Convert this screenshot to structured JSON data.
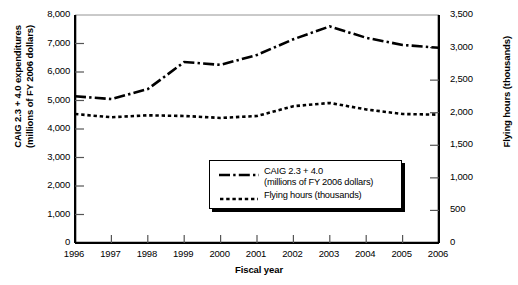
{
  "chart_data": {
    "type": "line",
    "title": "",
    "xlabel": "Fiscal year",
    "ylabel": "CAIG 2.3 + 4.0 expenditures (millions of FY 2006 dollars)",
    "ylabel_secondary": "Flying hours (thousands)",
    "categories": [
      "1996",
      "1997",
      "1998",
      "1999",
      "2000",
      "2001",
      "2002",
      "2003",
      "2004",
      "2005",
      "2006"
    ],
    "x": [
      1996,
      1997,
      1998,
      1999,
      2000,
      2001,
      2002,
      2003,
      2004,
      2005,
      2006
    ],
    "ylim": [
      0,
      8000
    ],
    "ylim_secondary": [
      0,
      3500
    ],
    "yticks": [
      "0",
      "1,000",
      "2,000",
      "3,000",
      "4,000",
      "5,000",
      "6,000",
      "7,000",
      "8,000"
    ],
    "ytick_values": [
      0,
      1000,
      2000,
      3000,
      4000,
      5000,
      6000,
      7000,
      8000
    ],
    "yticks_secondary": [
      "0",
      "500",
      "1,000",
      "1,500",
      "2,000",
      "2,500",
      "3,000",
      "3,500"
    ],
    "ytick_values_secondary": [
      0,
      500,
      1000,
      1500,
      2000,
      2500,
      3000,
      3500
    ],
    "grid": false,
    "legend_position": "center-right-inside",
    "series": [
      {
        "name": "CAIG 2.3 + 4.0 (millions of FY 2006 dollars)",
        "legend_label_line1": "CAIG 2.3 + 4.0",
        "legend_label_line2": "(millions of FY 2006 dollars)",
        "axis": "left",
        "style": "dash-dot",
        "color": "#000000",
        "values": [
          5150,
          5050,
          5400,
          6350,
          6250,
          6600,
          7150,
          7600,
          7200,
          6950,
          6850
        ]
      },
      {
        "name": "Flying hours (thousands)",
        "legend_label_line1": "Flying hours (thousands)",
        "axis": "right",
        "style": "dotted",
        "color": "#000000",
        "values": [
          1980,
          1930,
          1960,
          1950,
          1920,
          1950,
          2100,
          2150,
          2050,
          1980,
          1970
        ]
      }
    ]
  },
  "axes": {
    "x_title": "Fiscal year",
    "y_left_title_line1": "CAIG 2.3 + 4.0 expenditures",
    "y_left_title_line2": "(millions of FY 2006 dollars)",
    "y_right_title": "Flying hours (thousands)"
  }
}
